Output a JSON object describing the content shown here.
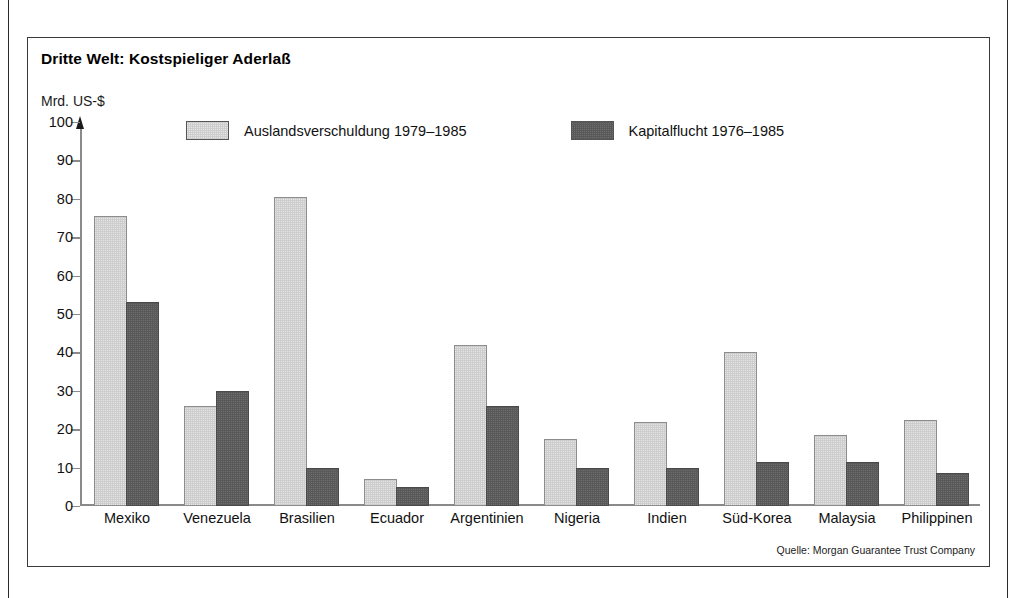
{
  "chart_data": {
    "type": "bar",
    "title": "Dritte Welt: Kostspieliger Aderlaß",
    "ylabel": "Mrd. US-$",
    "xlabel": "",
    "ylim": [
      0,
      100
    ],
    "yticks": [
      0,
      10,
      20,
      30,
      40,
      50,
      60,
      70,
      80,
      90,
      100
    ],
    "grid": false,
    "legend_position": "top",
    "source": "Quelle: Morgan Guarantee Trust Company",
    "categories": [
      "Mexiko",
      "Venezuela",
      "Brasilien",
      "Ecuador",
      "Argentinien",
      "Nigeria",
      "Indien",
      "Süd-Korea",
      "Malaysia",
      "Philippinen"
    ],
    "series": [
      {
        "name": "Auslandsverschuldung 1979–1985",
        "color": "#cdcdcd",
        "values": [
          75.5,
          26.0,
          80.5,
          7.0,
          42.0,
          17.5,
          22.0,
          40.0,
          18.5,
          22.5
        ]
      },
      {
        "name": "Kapitalflucht 1976–1985",
        "color": "#595959",
        "values": [
          53.0,
          30.0,
          10.0,
          5.0,
          26.0,
          10.0,
          9.8,
          11.5,
          11.5,
          8.5
        ]
      }
    ]
  },
  "colors": {
    "series_light": "#cdcdcd",
    "series_dark": "#595959",
    "frame": "#3a3a3a",
    "axis": "#8a8a8a",
    "text": "#111111",
    "background": "#ffffff"
  }
}
